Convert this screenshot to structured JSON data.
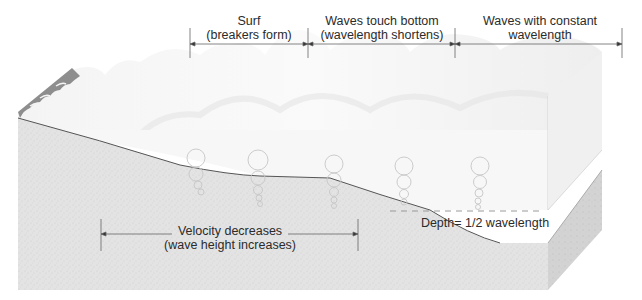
{
  "diagram": {
    "type": "block-diagram",
    "zones": [
      {
        "id": "surf",
        "line1": "Surf",
        "line2": "(breakers form)"
      },
      {
        "id": "touch",
        "line1": "Waves touch bottom",
        "line2": "(wavelength shortens)"
      },
      {
        "id": "constant",
        "line1": "Waves with constant",
        "line2": "wavelength"
      }
    ],
    "velocity_label": {
      "line1": "Velocity decreases",
      "line2": "(wave height increases)"
    },
    "depth_label": "Depth= 1/2 wavelength",
    "orbit_columns": 5,
    "colors": {
      "water_top": "#f2f2f2",
      "water_front": "#f7f7f7",
      "sediment": "#e2e2e2",
      "sediment_side": "#cfcfcf",
      "beach": "#8e8e8e",
      "line": "#555555",
      "dashed": "#9a9a9a",
      "text": "#2b2b2b"
    }
  }
}
